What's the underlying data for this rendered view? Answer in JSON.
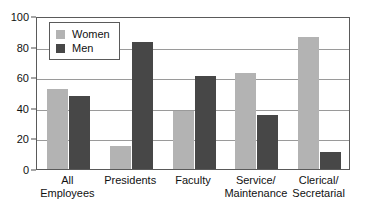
{
  "chart_data": {
    "type": "bar",
    "title": "",
    "subtitle": "",
    "xlabel": "",
    "ylabel": "",
    "ylim": [
      0,
      100
    ],
    "yticks": [
      0,
      20,
      40,
      60,
      80,
      100
    ],
    "grid": "horizontal",
    "legend_position": "top-left-inside",
    "categories": [
      "All\nEmployees",
      "Presidents",
      "Faculty",
      "Service/\nMaintenance",
      "Clerical/\nSecretarial"
    ],
    "series": [
      {
        "name": "Women",
        "color": "#b3b3b3",
        "values": [
          52,
          15,
          38,
          63,
          86
        ]
      },
      {
        "name": "Men",
        "color": "#474747",
        "values": [
          48,
          83,
          61,
          35,
          11
        ]
      }
    ]
  },
  "legend": {
    "items": [
      {
        "label": "Women",
        "swatch": "women"
      },
      {
        "label": "Men",
        "swatch": "men"
      }
    ]
  },
  "axis": {
    "y_tick_labels": [
      "100",
      "80",
      "60",
      "40",
      "20",
      "0"
    ]
  },
  "colors": {
    "women": "#b3b3b3",
    "men": "#474747",
    "frame": "#5a5a5a",
    "gridline": "#9a9a9a",
    "text": "#111111",
    "background": "#ffffff"
  }
}
